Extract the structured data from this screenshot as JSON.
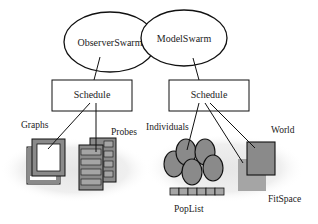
{
  "diagram": {
    "nodes": {
      "observer_swarm": {
        "label": "ObserverSwarm",
        "shape": "ellipse"
      },
      "model_swarm": {
        "label": "ModelSwarm",
        "shape": "ellipse"
      },
      "observer_schedule": {
        "label": "Schedule",
        "shape": "rect"
      },
      "model_schedule": {
        "label": "Schedule",
        "shape": "rect"
      }
    },
    "groups": {
      "graphs": {
        "label": "Graphs"
      },
      "probes": {
        "label": "Probes"
      },
      "individuals": {
        "label": "Individuals"
      },
      "world": {
        "label": "World"
      },
      "poplist": {
        "label": "PopList"
      },
      "fitspace": {
        "label": "FitSpace"
      }
    },
    "edges": [
      {
        "from": "ObserverSwarm",
        "to": "Schedule"
      },
      {
        "from": "ModelSwarm",
        "to": "Schedule"
      },
      {
        "from": "Schedule",
        "to": "Graphs"
      },
      {
        "from": "Schedule",
        "to": "Probes"
      },
      {
        "from": "Schedule",
        "to": "Individuals"
      },
      {
        "from": "Schedule",
        "to": "FitSpace"
      },
      {
        "from": "Schedule",
        "to": "World"
      }
    ],
    "colors": {
      "stroke": "#111111",
      "fill_gray": "#8a8a8a",
      "fill_light_gray": "#a5a5a5",
      "haze": "#ececec"
    }
  }
}
